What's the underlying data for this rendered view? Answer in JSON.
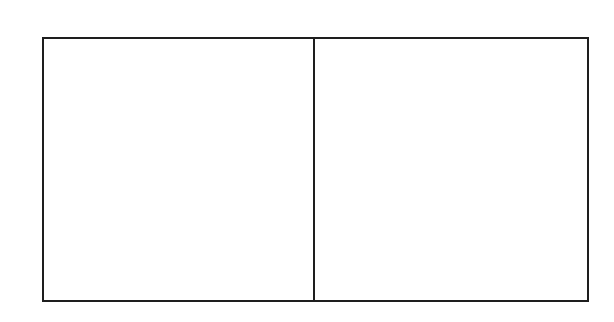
{
  "diagram": {
    "canvas": {
      "width": 614,
      "height": 322,
      "background": "#ffffff"
    },
    "stroke_color": "#1e1e1e",
    "stroke_width": 2,
    "outer_box": {
      "x": 43,
      "y": 38,
      "width": 545,
      "height": 263
    },
    "divider": {
      "x": 314,
      "y1": 38,
      "y2": 301
    },
    "panels": [
      {
        "name": "left-panel",
        "x": 43,
        "y": 38,
        "width": 271,
        "height": 263,
        "label": ""
      },
      {
        "name": "right-panel",
        "x": 314,
        "y": 38,
        "width": 274,
        "height": 263,
        "label": ""
      }
    ]
  }
}
